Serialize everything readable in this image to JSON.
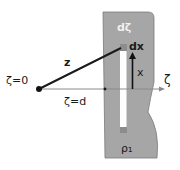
{
  "diagram": {
    "labels": {
      "origin": "ζ=0",
      "plane_position": "ζ=d",
      "distance": "z",
      "axis": "ζ",
      "slab_element": "dζ",
      "strip_element": "dx",
      "height": "x",
      "density": "ρ₁"
    },
    "colors": {
      "slab": "#a6a6a6",
      "slab_border": "#6e6e6e",
      "strip": "#ffffff",
      "element_square": "#8c8c8c",
      "line": "#1a1a1a",
      "axis": "#8a8a8a"
    }
  }
}
